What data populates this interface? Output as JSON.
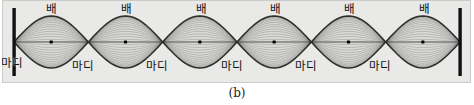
{
  "figure": {
    "caption": "(b)",
    "panel": {
      "background_color": "#e9e9e7",
      "border_color": "#96968f",
      "width": 469,
      "height": 83
    },
    "wall": {
      "name": "fixed-end-wall",
      "color": "#111111",
      "left_x": 14,
      "right_x": 460,
      "top_y": 8,
      "bottom_y": 76
    },
    "labels": {
      "antinode": "배",
      "node": "마디"
    },
    "antinode_labels": [
      {
        "text": "배",
        "x": 46,
        "y": 3
      },
      {
        "text": "배",
        "x": 121,
        "y": 3
      },
      {
        "text": "배",
        "x": 196,
        "y": 3
      },
      {
        "text": "배",
        "x": 270,
        "y": 3
      },
      {
        "text": "배",
        "x": 344,
        "y": 3
      },
      {
        "text": "배",
        "x": 419,
        "y": 3
      }
    ],
    "node_labels": [
      {
        "text": "마디",
        "x": 1,
        "y": 57
      },
      {
        "text": "마디",
        "x": 72,
        "y": 60
      },
      {
        "text": "마디",
        "x": 146,
        "y": 60
      },
      {
        "text": "마디",
        "x": 221,
        "y": 60
      },
      {
        "text": "마디",
        "x": 295,
        "y": 60
      },
      {
        "text": "마디",
        "x": 369,
        "y": 60
      }
    ]
  },
  "chart_data": {
    "type": "line",
    "title": "",
    "subtitle": "",
    "xlabel": "",
    "ylabel": "",
    "harmonic_number": 6,
    "loop_count": 6,
    "node_count": 7,
    "antinode_count": 6,
    "xlim": [
      14,
      460
    ],
    "ylim": [
      -26,
      26
    ],
    "grid": false,
    "legend": null,
    "node_x": [
      14,
      88.33,
      162.67,
      237,
      311.33,
      385.67,
      460
    ],
    "antinode_x": [
      51.17,
      125.5,
      199.83,
      274.17,
      348.5,
      422.83
    ],
    "antinode_y": 42,
    "amplitude_px": 26,
    "snapshot_count": 23,
    "snapshot_amplitude_fractions": [
      1.0,
      0.97,
      0.93,
      0.88,
      0.82,
      0.75,
      0.67,
      0.59,
      0.5,
      0.41,
      0.31,
      0.21,
      0.1,
      0.0,
      -0.1,
      -0.21,
      -0.31,
      -0.41,
      -0.5,
      -0.59,
      -0.67,
      -0.75,
      -0.82,
      -0.88,
      -0.93,
      -0.97,
      -1.0
    ],
    "envelope_color": "#2a2a2a",
    "snapshot_color": "#5a5a5a",
    "marker_color": "#000000",
    "baseline_color": "#3a3a3a",
    "series": [
      {
        "name": "envelope-upper",
        "values": [
          0,
          26,
          0,
          26,
          0,
          26,
          0,
          26,
          0,
          26,
          0,
          26,
          0
        ]
      },
      {
        "name": "envelope-lower",
        "values": [
          0,
          -26,
          0,
          -26,
          0,
          -26,
          0,
          -26,
          0,
          -26,
          0,
          -26,
          0
        ]
      },
      {
        "name": "antinode-markers",
        "values": [
          0,
          0,
          0,
          0,
          0,
          0
        ]
      }
    ]
  }
}
